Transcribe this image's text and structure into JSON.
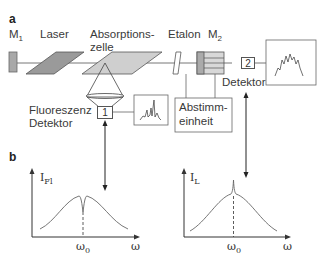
{
  "panel_a": {
    "label": "a",
    "components": {
      "mirror1": "M",
      "mirror1_sub": "1",
      "laser": "Laser",
      "absorption_cell_line1": "Absorptions-",
      "absorption_cell_line2": "zelle",
      "etalon": "Etalon",
      "mirror2": "M",
      "mirror2_sub": "2",
      "detector1_number": "1",
      "detector2_number": "2",
      "fluorescence_detector_line1": "Fluoreszenz",
      "fluorescence_detector_line2": "Detektor",
      "detector2_label": "Detektor",
      "tuning_unit_line1": "Abstimm-",
      "tuning_unit_line2": "einheit"
    }
  },
  "panel_b": {
    "label": "b",
    "left_plot": {
      "ylabel": "I",
      "ylabel_sub": "Fl",
      "xlabel": "ω",
      "xtick": "ω",
      "xtick_sub": "0",
      "feature": "dip at ω0"
    },
    "right_plot": {
      "ylabel": "I",
      "ylabel_sub": "L",
      "xlabel": "ω",
      "xtick": "ω",
      "xtick_sub": "0",
      "feature": "peak at ω0"
    }
  },
  "colors": {
    "line": "#555555",
    "laser_fill": "#9a9a9a",
    "cell_fill": "#cfcfcf",
    "mirror_fill": "#a8a8a8"
  }
}
